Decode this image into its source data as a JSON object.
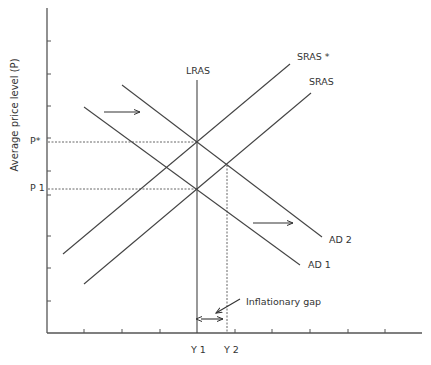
{
  "diagram": {
    "y_axis_label": "Average price level (P)",
    "price_labels": {
      "p_star": "P*",
      "p1": "P 1"
    },
    "output_labels": {
      "y1": "Y 1",
      "y2": "Y 2"
    },
    "curves": {
      "lras": "LRAS",
      "sras_star": "SRAS *",
      "sras": "SRAS",
      "ad2": "AD 2",
      "ad1": "AD 1"
    },
    "annotation": "Inflationary gap",
    "colors": {
      "line": "#444444",
      "text": "#333333",
      "background": "#ffffff"
    }
  }
}
